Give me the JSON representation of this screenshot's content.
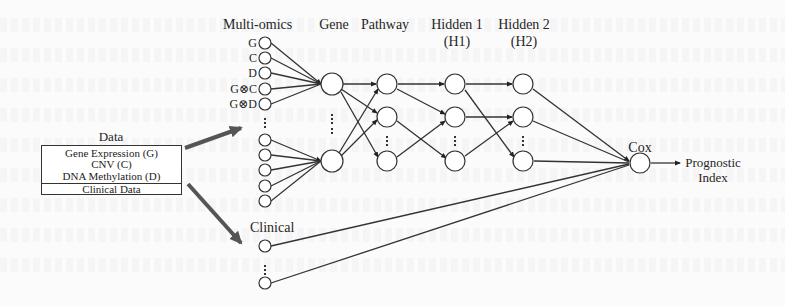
{
  "data_box": {
    "title": "Data",
    "omics_items": [
      "Gene Expression (G)",
      "CNV (C)",
      "DNA Methylation (D)"
    ],
    "clinical_item": "Clinical Data"
  },
  "layers": {
    "multiomics": {
      "label": "Multi-omics",
      "node_labels": [
        "G",
        "C",
        "D",
        "G⊗C",
        "G⊗D"
      ]
    },
    "gene": {
      "label": "Gene"
    },
    "pathway": {
      "label": "Pathway"
    },
    "hidden1": {
      "label": "Hidden 1",
      "sublabel": "(H1)"
    },
    "hidden2": {
      "label": "Hidden 2",
      "sublabel": "(H2)"
    },
    "clinical": {
      "label": "Clinical"
    },
    "cox": {
      "label": "Cox"
    },
    "output": {
      "label_line1": "Prognostic",
      "label_line2": "Index"
    }
  },
  "colors": {
    "background": "#fbfbfb",
    "line": "#333333",
    "thick_arrow": "#555555",
    "node_fill": "#ffffff"
  }
}
